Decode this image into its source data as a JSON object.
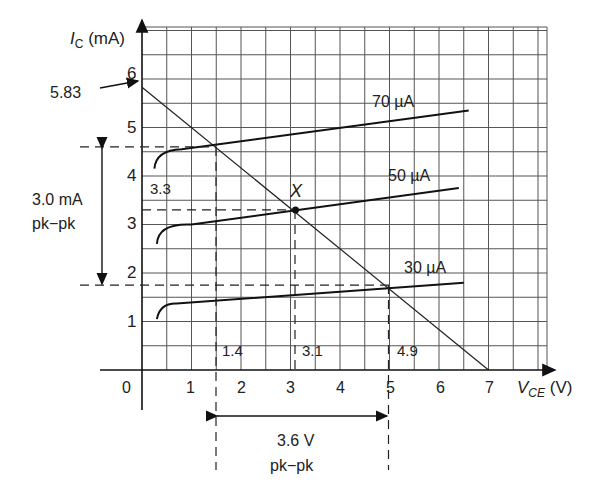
{
  "chart_data": {
    "type": "line",
    "title": "",
    "xlabel": "V_CE (V)",
    "ylabel": "I_C (mA)",
    "xlim": [
      0,
      7.2
    ],
    "ylim": [
      0,
      6.5
    ],
    "grid": true,
    "x_ticks": [
      "0",
      "1",
      "2",
      "3",
      "4",
      "5",
      "6",
      "7"
    ],
    "y_ticks": [
      "1",
      "2",
      "3",
      "4",
      "5",
      "6"
    ],
    "series": [
      {
        "name": "70 µA",
        "x": [
          0.25,
          0.4,
          0.8,
          6.6
        ],
        "y": [
          4.15,
          4.45,
          4.55,
          5.35
        ]
      },
      {
        "name": "50 µA",
        "x": [
          0.3,
          0.5,
          1.0,
          6.4
        ],
        "y": [
          2.6,
          2.9,
          3.0,
          3.75
        ]
      },
      {
        "name": "30 µA",
        "x": [
          0.3,
          0.45,
          0.7,
          6.5
        ],
        "y": [
          1.05,
          1.3,
          1.37,
          1.8
        ]
      },
      {
        "name": "load line",
        "x": [
          0,
          7
        ],
        "y": [
          5.83,
          0
        ]
      }
    ],
    "operating_point": {
      "label": "X",
      "x": 3.1,
      "y": 3.3
    },
    "annotations": {
      "intercept": "5.83",
      "q_current": "3.3",
      "v_low": "1.4",
      "v_q": "3.1",
      "v_high": "4.9",
      "i_high": 4.6,
      "i_low": 1.75,
      "current_swing": [
        "3.0 mA",
        "pk−pk"
      ],
      "voltage_swing": [
        "3.6 V",
        "pk−pk"
      ]
    }
  },
  "labels": {
    "y_axis_main": "I",
    "y_axis_sub": "C",
    "y_axis_unit": " (mA)",
    "x_axis_main": "V",
    "x_axis_sub": "CE",
    "x_axis_unit": " (V)",
    "curve70": "70 µA",
    "curve50": "50 µA",
    "curve30": "30 µA",
    "point": "X",
    "intercept": "5.83",
    "q_current": "3.3",
    "v_low": "1.4",
    "v_q": "3.1",
    "v_high": "4.9",
    "i_swing_1": "3.0 mA",
    "i_swing_2": "pk−pk",
    "v_swing_1": "3.6 V",
    "v_swing_2": "pk−pk",
    "tick0": "0",
    "tick1": "1",
    "tick2": "2",
    "tick3": "3",
    "tick4": "4",
    "tick5": "5",
    "tick6": "6",
    "tick7": "7",
    "ytick1": "1",
    "ytick2": "2",
    "ytick3": "3",
    "ytick4": "4",
    "ytick5": "5",
    "ytick6": "6"
  }
}
